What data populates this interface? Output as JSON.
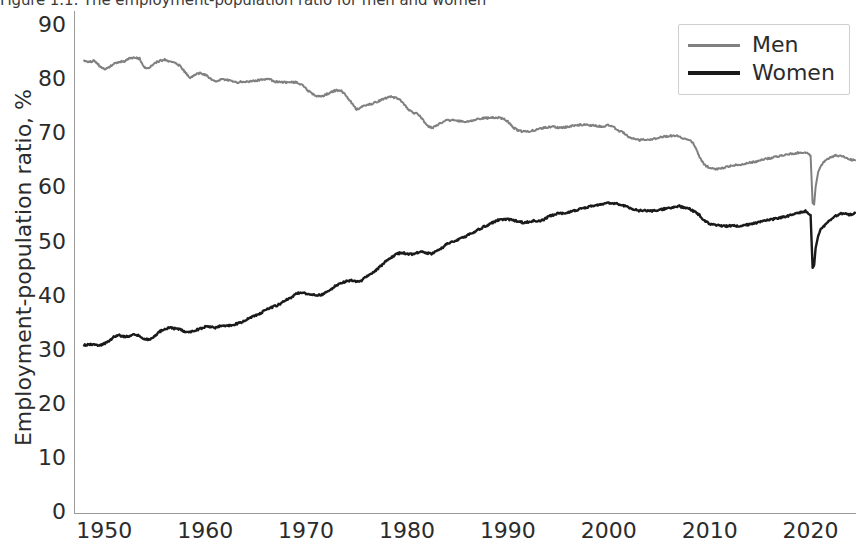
{
  "chart_data": {
    "type": "line",
    "title": "Figure 1.1: The employment-population ratio for men and women",
    "xlabel": "",
    "ylabel": "Employment-population ratio, %",
    "xlim": [
      1947,
      2024.5
    ],
    "ylim": [
      0,
      93
    ],
    "grid": false,
    "legend_position": "upper right",
    "xticks": [
      1950,
      1960,
      1970,
      1980,
      1990,
      2000,
      2010,
      2020
    ],
    "yticks": [
      0,
      10,
      20,
      30,
      40,
      50,
      60,
      70,
      80,
      90
    ],
    "series": [
      {
        "name": "Men",
        "color": "#808080",
        "linewidth": 2.0,
        "x": [
          1948.0,
          1948.5,
          1949.0,
          1949.5,
          1950.0,
          1950.5,
          1951.0,
          1951.5,
          1952.0,
          1952.5,
          1953.0,
          1953.5,
          1954.0,
          1954.5,
          1955.0,
          1955.5,
          1956.0,
          1956.5,
          1957.0,
          1957.5,
          1958.0,
          1958.5,
          1959.0,
          1959.5,
          1960.0,
          1960.5,
          1961.0,
          1961.5,
          1962.0,
          1962.5,
          1963.0,
          1963.5,
          1964.0,
          1964.5,
          1965.0,
          1965.5,
          1966.0,
          1966.5,
          1967.0,
          1967.5,
          1968.0,
          1968.5,
          1969.0,
          1969.5,
          1970.0,
          1970.5,
          1971.0,
          1971.5,
          1972.0,
          1972.5,
          1973.0,
          1973.5,
          1974.0,
          1974.5,
          1975.0,
          1975.5,
          1976.0,
          1976.5,
          1977.0,
          1977.5,
          1978.0,
          1978.5,
          1979.0,
          1979.5,
          1980.0,
          1980.5,
          1981.0,
          1981.5,
          1982.0,
          1982.5,
          1983.0,
          1983.5,
          1984.0,
          1984.5,
          1985.0,
          1985.5,
          1986.0,
          1986.5,
          1987.0,
          1987.5,
          1988.0,
          1988.5,
          1989.0,
          1989.5,
          1990.0,
          1990.5,
          1991.0,
          1991.5,
          1992.0,
          1992.5,
          1993.0,
          1993.5,
          1994.0,
          1994.5,
          1995.0,
          1995.5,
          1996.0,
          1996.5,
          1997.0,
          1997.5,
          1998.0,
          1998.5,
          1999.0,
          1999.5,
          2000.0,
          2000.5,
          2001.0,
          2001.5,
          2002.0,
          2002.5,
          2003.0,
          2003.5,
          2004.0,
          2004.5,
          2005.0,
          2005.5,
          2006.0,
          2006.5,
          2007.0,
          2007.5,
          2008.0,
          2008.5,
          2009.0,
          2009.5,
          2010.0,
          2010.5,
          2011.0,
          2011.5,
          2012.0,
          2012.5,
          2013.0,
          2013.5,
          2014.0,
          2014.5,
          2015.0,
          2015.5,
          2016.0,
          2016.5,
          2017.0,
          2017.5,
          2018.0,
          2018.5,
          2019.0,
          2019.5,
          2020.0,
          2020.2,
          2020.35,
          2020.5,
          2020.75,
          2021.0,
          2021.5,
          2022.0,
          2022.5,
          2023.0,
          2023.5,
          2024.0,
          2024.4
        ],
        "y": [
          83.9,
          83.6,
          83.8,
          82.9,
          82.2,
          82.6,
          83.4,
          83.6,
          83.7,
          84.3,
          84.4,
          84.2,
          82.5,
          82.6,
          83.4,
          83.8,
          84.0,
          83.6,
          83.4,
          82.9,
          81.7,
          80.7,
          81.3,
          81.5,
          81.2,
          80.6,
          79.9,
          80.3,
          80.3,
          80.1,
          79.8,
          79.9,
          79.9,
          80.0,
          80.1,
          80.3,
          80.4,
          80.3,
          79.9,
          79.9,
          79.8,
          79.9,
          79.8,
          79.5,
          78.6,
          77.8,
          77.3,
          77.2,
          77.6,
          78.0,
          78.4,
          78.2,
          77.3,
          76.0,
          74.8,
          75.2,
          75.7,
          75.8,
          76.2,
          76.6,
          77.0,
          77.1,
          76.9,
          76.3,
          75.1,
          74.3,
          74.0,
          73.1,
          71.8,
          71.4,
          71.9,
          72.4,
          72.8,
          72.8,
          72.7,
          72.6,
          72.6,
          72.8,
          73.0,
          73.2,
          73.2,
          73.3,
          73.3,
          73.1,
          72.6,
          71.5,
          70.9,
          70.7,
          70.7,
          70.9,
          71.1,
          71.4,
          71.5,
          71.6,
          71.4,
          71.5,
          71.6,
          71.8,
          71.9,
          72.0,
          71.9,
          71.8,
          71.7,
          71.7,
          71.9,
          71.5,
          70.9,
          70.4,
          69.7,
          69.3,
          69.1,
          69.3,
          69.2,
          69.4,
          69.6,
          69.8,
          69.9,
          70.0,
          69.8,
          69.4,
          69.2,
          68.2,
          65.9,
          64.5,
          64.0,
          63.7,
          63.8,
          64.1,
          64.3,
          64.5,
          64.6,
          64.8,
          65.0,
          65.1,
          65.4,
          65.6,
          65.8,
          66.0,
          66.2,
          66.4,
          66.6,
          66.7,
          66.8,
          66.9,
          66.3,
          57.5,
          57.2,
          60.5,
          63.2,
          64.3,
          65.5,
          66.0,
          66.3,
          66.2,
          65.8,
          65.5,
          65.4
        ],
        "description": "Men's employment-population ratio declines from about 84% in 1948 to about 65% in 2024, with a sharp COVID-19 trough near 57% in spring 2020."
      },
      {
        "name": "Women",
        "color": "#1a1a1a",
        "linewidth": 2.4,
        "x": [
          1948.0,
          1948.5,
          1949.0,
          1949.5,
          1950.0,
          1950.5,
          1951.0,
          1951.5,
          1952.0,
          1952.5,
          1953.0,
          1953.5,
          1954.0,
          1954.5,
          1955.0,
          1955.5,
          1956.0,
          1956.5,
          1957.0,
          1957.5,
          1958.0,
          1958.5,
          1959.0,
          1959.5,
          1960.0,
          1960.5,
          1961.0,
          1961.5,
          1962.0,
          1962.5,
          1963.0,
          1963.5,
          1964.0,
          1964.5,
          1965.0,
          1965.5,
          1966.0,
          1966.5,
          1967.0,
          1967.5,
          1968.0,
          1968.5,
          1969.0,
          1969.5,
          1970.0,
          1970.5,
          1971.0,
          1971.5,
          1972.0,
          1972.5,
          1973.0,
          1973.5,
          1974.0,
          1974.5,
          1975.0,
          1975.5,
          1976.0,
          1976.5,
          1977.0,
          1977.5,
          1978.0,
          1978.5,
          1979.0,
          1979.5,
          1980.0,
          1980.5,
          1981.0,
          1981.5,
          1982.0,
          1982.5,
          1983.0,
          1983.5,
          1984.0,
          1984.5,
          1985.0,
          1985.5,
          1986.0,
          1986.5,
          1987.0,
          1987.5,
          1988.0,
          1988.5,
          1989.0,
          1989.5,
          1990.0,
          1990.5,
          1991.0,
          1991.5,
          1992.0,
          1992.5,
          1993.0,
          1993.5,
          1994.0,
          1994.5,
          1995.0,
          1995.5,
          1996.0,
          1996.5,
          1997.0,
          1997.5,
          1998.0,
          1998.5,
          1999.0,
          1999.5,
          2000.0,
          2000.5,
          2001.0,
          2001.5,
          2002.0,
          2002.5,
          2003.0,
          2003.5,
          2004.0,
          2004.5,
          2005.0,
          2005.5,
          2006.0,
          2006.5,
          2007.0,
          2007.5,
          2008.0,
          2008.5,
          2009.0,
          2009.5,
          2010.0,
          2010.5,
          2011.0,
          2011.5,
          2012.0,
          2012.5,
          2013.0,
          2013.5,
          2014.0,
          2014.5,
          2015.0,
          2015.5,
          2016.0,
          2016.5,
          2017.0,
          2017.5,
          2018.0,
          2018.5,
          2019.0,
          2019.5,
          2020.0,
          2020.2,
          2020.35,
          2020.5,
          2020.75,
          2021.0,
          2021.5,
          2022.0,
          2022.5,
          2023.0,
          2023.5,
          2024.0,
          2024.4
        ],
        "y": [
          31.2,
          31.3,
          31.4,
          31.1,
          31.5,
          32.0,
          32.8,
          33.0,
          32.8,
          32.9,
          33.2,
          32.9,
          32.3,
          32.3,
          32.9,
          33.7,
          34.3,
          34.4,
          34.3,
          34.2,
          33.7,
          33.6,
          34.0,
          34.2,
          34.6,
          34.6,
          34.4,
          34.8,
          34.8,
          34.8,
          35.1,
          35.4,
          35.8,
          36.3,
          36.7,
          37.1,
          37.8,
          38.1,
          38.5,
          38.9,
          39.6,
          40.0,
          40.7,
          41.0,
          40.8,
          40.6,
          40.4,
          40.5,
          41.0,
          41.6,
          42.3,
          42.7,
          43.0,
          43.3,
          42.9,
          43.2,
          43.9,
          44.4,
          45.2,
          46.0,
          46.9,
          47.5,
          48.1,
          48.3,
          48.1,
          48.0,
          48.3,
          48.4,
          48.2,
          48.1,
          48.7,
          49.2,
          50.0,
          50.3,
          50.7,
          51.1,
          51.5,
          52.0,
          52.5,
          53.0,
          53.4,
          53.9,
          54.3,
          54.5,
          54.5,
          54.3,
          54.1,
          53.9,
          54.0,
          54.2,
          54.2,
          54.3,
          55.0,
          55.3,
          55.6,
          55.6,
          55.8,
          56.0,
          56.3,
          56.6,
          56.8,
          57.0,
          57.2,
          57.4,
          57.5,
          57.5,
          57.3,
          57.0,
          56.6,
          56.3,
          56.1,
          56.1,
          56.0,
          56.1,
          56.2,
          56.4,
          56.6,
          56.8,
          56.9,
          56.6,
          56.4,
          55.9,
          55.2,
          54.2,
          53.6,
          53.4,
          53.4,
          53.2,
          53.3,
          53.3,
          53.3,
          53.4,
          53.6,
          53.8,
          54.0,
          54.2,
          54.4,
          54.6,
          54.8,
          55.0,
          55.2,
          55.5,
          55.8,
          56.0,
          55.3,
          45.5,
          46.0,
          49.2,
          51.4,
          52.6,
          53.5,
          54.5,
          55.1,
          55.6,
          55.5,
          55.3,
          55.7
        ],
        "description": "Women's employment-population ratio rises from about 31% in 1948 to a peak near 57.5% around 2000, eases to about 53% after 2009, and recovers to about 56% by 2024 after a COVID-19 trough near 45.5%."
      }
    ]
  },
  "legend": {
    "entries": [
      {
        "label": "Men"
      },
      {
        "label": "Women"
      }
    ]
  },
  "axis": {
    "y_ticks": [
      "0",
      "10",
      "20",
      "30",
      "40",
      "50",
      "60",
      "70",
      "80",
      "90"
    ],
    "x_ticks": [
      "1950",
      "1960",
      "1970",
      "1980",
      "1990",
      "2000",
      "2010",
      "2020"
    ]
  }
}
